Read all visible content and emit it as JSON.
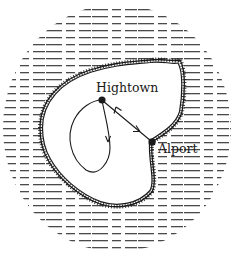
{
  "map": {
    "type": "island-schematic",
    "colors": {
      "ink": "#1a1a1a",
      "water_hatch": "#2a2a2a",
      "land": "#ffffff",
      "background": "#ffffff"
    },
    "towns": [
      {
        "name": "Hightown",
        "x": 102,
        "y": 100,
        "label_x": 96,
        "label_y": 92
      },
      {
        "name": "Alport",
        "x": 152,
        "y": 142,
        "label_x": 157,
        "label_y": 152
      }
    ],
    "routes": [
      {
        "id": "hightown-alport",
        "from": "Hightown",
        "to": "Alport",
        "style": "two-way-arrow"
      },
      {
        "id": "hightown-loop",
        "from": "Hightown",
        "to": "Hightown",
        "style": "one-way-loop"
      }
    ],
    "coastline": {
      "style": "hachured"
    },
    "water": {
      "style": "dashed-horizontal-lines"
    }
  }
}
